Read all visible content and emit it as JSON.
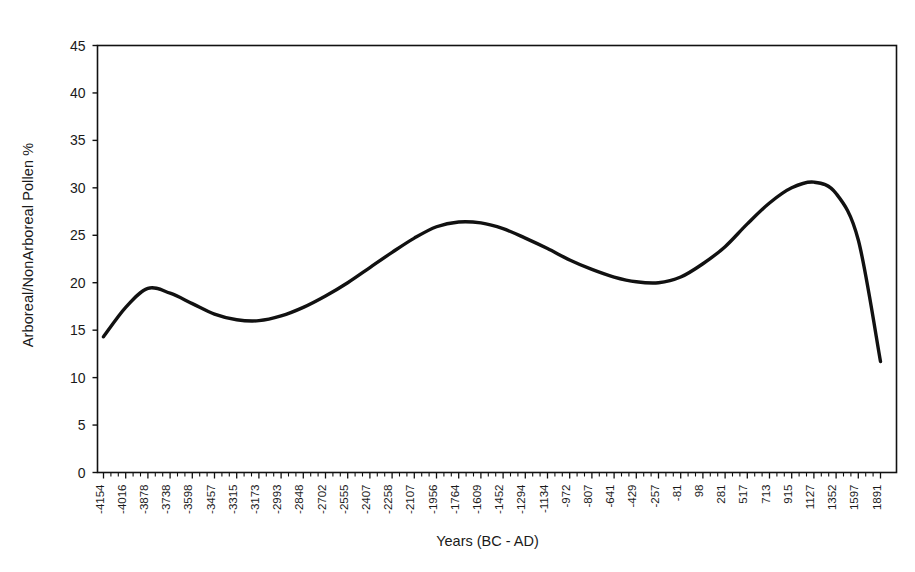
{
  "chart_data": {
    "type": "line",
    "title": "",
    "xlabel": "Years (BC - AD)",
    "ylabel": "Arboreal/NonArboreal Pollen %",
    "ylim": [
      0,
      45
    ],
    "yticks": [
      0,
      5,
      10,
      15,
      20,
      25,
      30,
      35,
      40,
      45
    ],
    "grid": false,
    "legend": "none",
    "minor_ticks_per_major": 3,
    "line_color": "#111111",
    "line_width": 3.4,
    "categories": [
      "-4154",
      "-4016",
      "-3878",
      "-3738",
      "-3598",
      "-3457",
      "-3315",
      "-3173",
      "-2993",
      "-2848",
      "-2702",
      "-2555",
      "-2407",
      "-2258",
      "-2107",
      "-1956",
      "-1764",
      "-1609",
      "-1452",
      "-1294",
      "-1134",
      "-972",
      "-807",
      "-641",
      "-429",
      "-257",
      "-81",
      "98",
      "281",
      "517",
      "713",
      "915",
      "1127",
      "1352",
      "1597",
      "1891"
    ],
    "values": [
      14.3,
      17.4,
      19.4,
      18.9,
      17.8,
      16.7,
      16.1,
      16.0,
      16.5,
      17.4,
      18.6,
      20.0,
      21.6,
      23.2,
      24.7,
      25.9,
      26.4,
      26.3,
      25.7,
      24.7,
      23.6,
      22.4,
      21.4,
      20.6,
      20.1,
      20.0,
      20.6,
      22.0,
      23.8,
      26.2,
      28.4,
      30.0,
      30.6,
      29.4,
      24.5,
      11.7
    ],
    "series_name": "Arboreal/NonArboreal Pollen %"
  },
  "axis": {
    "y_title": "Arboreal/NonArboreal Pollen %",
    "x_title": "Years (BC - AD)"
  }
}
